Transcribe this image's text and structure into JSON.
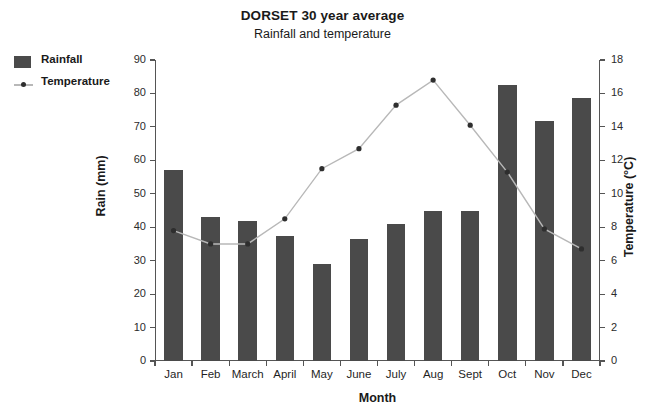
{
  "chart_data": {
    "type": "bar",
    "title": "DORSET 30 year average",
    "subtitle": "Rainfall and temperature",
    "xlabel": "Month",
    "ylabel": "Rain (mm)",
    "ylabel_secondary": "Temperature (°C)",
    "categories": [
      "Jan",
      "Feb",
      "March",
      "April",
      "May",
      "June",
      "July",
      "Aug",
      "Sept",
      "Oct",
      "Nov",
      "Dec"
    ],
    "ylim": [
      0,
      90
    ],
    "yticks": [
      0,
      10,
      20,
      30,
      40,
      50,
      60,
      70,
      80,
      90
    ],
    "ylim_secondary": [
      0,
      18
    ],
    "yticks_secondary": [
      0,
      2,
      4,
      6,
      8,
      10,
      12,
      14,
      16,
      18
    ],
    "grid": false,
    "legend_position": "top-left-outside",
    "series": [
      {
        "name": "Rainfall",
        "type": "bar",
        "axis": "left",
        "unit": "mm",
        "color": "#4a4a4a",
        "values": [
          57,
          43,
          42,
          37.5,
          29,
          36.5,
          41,
          45,
          45,
          82.5,
          71.8,
          78.7
        ]
      },
      {
        "name": "Temperature",
        "type": "line",
        "axis": "right",
        "unit": "°C",
        "color": "#b8b8b8",
        "marker_color": "#2e2e2e",
        "values": [
          7.8,
          7.0,
          7.0,
          8.5,
          11.5,
          12.7,
          15.3,
          16.8,
          14.1,
          11.3,
          7.9,
          6.7
        ]
      }
    ]
  },
  "legend": {
    "items": [
      {
        "label": "Rainfall"
      },
      {
        "label": "Temperature"
      }
    ]
  }
}
